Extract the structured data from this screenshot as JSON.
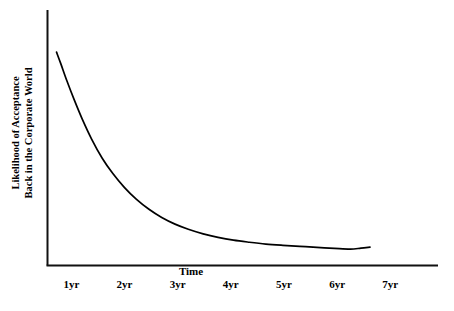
{
  "chart_data": {
    "type": "line",
    "title": "",
    "subtitle": "",
    "xlabel": "Time",
    "ylabel": "Likelihood of Acceptance Back in the Corporate World",
    "ylabel_lines": [
      "Likelihood of Acceptance",
      "Back in the Corporate World"
    ],
    "xtick_labels": [
      "1yr",
      "2yr",
      "3yr",
      "4yr",
      "5yr",
      "6yr",
      "7yr"
    ],
    "xtick_values": [
      1,
      2,
      3,
      4,
      5,
      6,
      7
    ],
    "ytick_labels": [],
    "xlim": [
      0.55,
      7.9
    ],
    "ylim": [
      0,
      1
    ],
    "grid": false,
    "legend": null,
    "series": [
      {
        "name": "Likelihood of Acceptance",
        "color": "#000000",
        "x": [
          0.72,
          0.8,
          0.92,
          1.05,
          1.2,
          1.38,
          1.58,
          1.78,
          2.0,
          2.22,
          2.46,
          2.7,
          2.95,
          3.2,
          3.48,
          3.76,
          4.05,
          4.35,
          4.66,
          4.98,
          5.3,
          5.62,
          5.95,
          6.25,
          6.45,
          6.62
        ],
        "y": [
          0.835,
          0.79,
          0.72,
          0.65,
          0.575,
          0.495,
          0.42,
          0.36,
          0.305,
          0.26,
          0.22,
          0.188,
          0.162,
          0.142,
          0.124,
          0.11,
          0.099,
          0.091,
          0.084,
          0.079,
          0.075,
          0.071,
          0.067,
          0.064,
          0.068,
          0.072
        ]
      }
    ]
  },
  "axes": {
    "y_axis_name": "vertical-axis",
    "x_axis_name": "horizontal-axis"
  }
}
